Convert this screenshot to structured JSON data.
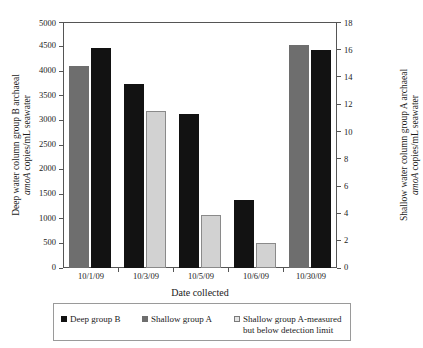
{
  "chart_data": {
    "type": "bar",
    "title": "",
    "categories": [
      "10/1/09",
      "10/3/09",
      "10/5/09",
      "10/6/09",
      "10/30/09"
    ],
    "xlabel": "Date collected",
    "ylabel": "Deep water column group B archaeal amoA copies/mL seawater",
    "y2label": "Shallow water column group A archaeal amoA copies/mL seawater",
    "ylim": [
      0,
      5000
    ],
    "y2lim": [
      0,
      18
    ],
    "yticks": [
      0,
      500,
      1000,
      1500,
      2000,
      2500,
      3000,
      3500,
      4000,
      4500,
      5000
    ],
    "y2ticks": [
      0,
      2,
      4,
      6,
      8,
      10,
      12,
      14,
      16,
      18
    ],
    "grid": false,
    "legend_position": "bottom",
    "series": [
      {
        "name": "Deep group B",
        "axis": "left",
        "color": "#121212",
        "values": [
          4470,
          3750,
          3140,
          1390,
          4430
        ]
      },
      {
        "name": "Shallow group A",
        "axis": "right",
        "color": "#6e6e6e",
        "values": [
          14.8,
          null,
          null,
          null,
          16.3
        ]
      },
      {
        "name": "Shallow group A-measured but below detection limit",
        "axis": "right",
        "color": "#d2d2d2",
        "values": [
          null,
          11.5,
          3.9,
          1.85,
          null
        ]
      }
    ]
  },
  "axes": {
    "left": {
      "title_line1": "Deep water column group B archaeal",
      "title_line2_italic": "amoA",
      "title_line2_rest": " copies/mL seawater",
      "ticks": [
        "0",
        "500",
        "1000",
        "1500",
        "2000",
        "2500",
        "3000",
        "3500",
        "4000",
        "4500",
        "5000"
      ]
    },
    "right": {
      "title_line1": "Shallow water column group A archaeal",
      "title_line2_italic": "amoA",
      "title_line2_rest": " copies/mL seawater",
      "ticks": [
        "0",
        "2",
        "4",
        "6",
        "8",
        "10",
        "12",
        "14",
        "16",
        "18"
      ]
    },
    "x": {
      "title": "Date collected",
      "ticks": [
        "10/1/09",
        "10/3/09",
        "10/5/09",
        "10/6/09",
        "10/30/09"
      ]
    }
  },
  "legend": {
    "entries": [
      {
        "label": "Deep group B",
        "label_line2": "",
        "swatch": "deepB"
      },
      {
        "label": "Shallow group A",
        "label_line2": "",
        "swatch": "shallowA"
      },
      {
        "label": "Shallow group A-measured",
        "label_line2": "but below detection limit",
        "swatch": "belowlimit"
      }
    ]
  }
}
